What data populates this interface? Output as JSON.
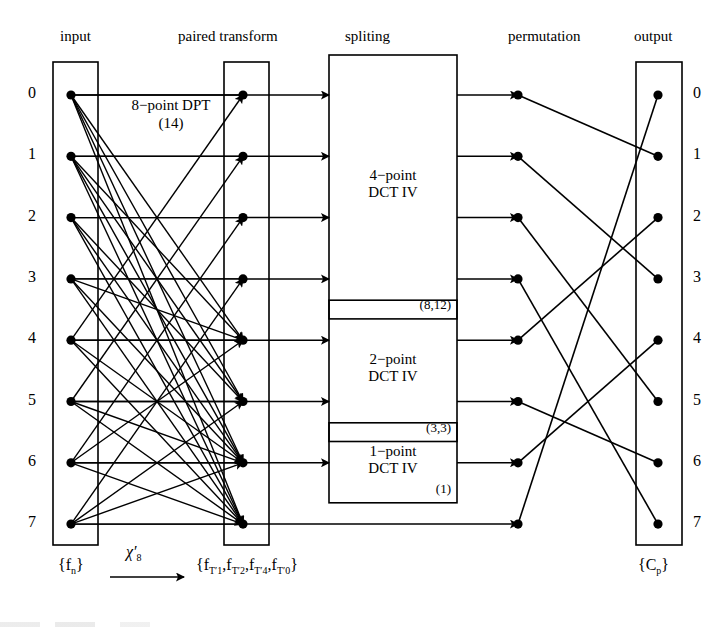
{
  "figure": {
    "columns": [
      {
        "key": "input",
        "label": "input"
      },
      {
        "key": "paired_transform",
        "label": "paired transform"
      },
      {
        "key": "splitting",
        "label": "spliting"
      },
      {
        "key": "permutation",
        "label": "permutation"
      },
      {
        "key": "output",
        "label": "output"
      }
    ],
    "input_indices": [
      "0",
      "1",
      "2",
      "3",
      "4",
      "5",
      "6",
      "7"
    ],
    "output_indices": [
      "0",
      "1",
      "2",
      "3",
      "4",
      "5",
      "6",
      "7"
    ],
    "annotations": {
      "dpt_name": "8−point DPT",
      "dpt_cost": "(14)",
      "input_set": "{f",
      "input_set_sub": "n",
      "input_set_close": "}",
      "arrow_symbol": "χ′",
      "arrow_symbol_sub": "8",
      "paired_set_open": "{f",
      "paired_terms": [
        "T′",
        "T′",
        "T′",
        "T′"
      ],
      "paired_term_subs": [
        "1",
        "2",
        "4",
        "0"
      ],
      "paired_set_close": "}",
      "output_set": "{C",
      "output_set_sub": "p",
      "output_set_close": "}"
    },
    "blocks": [
      {
        "name": "4-point DCT IV",
        "line1": "4−point",
        "line2": "DCT IV",
        "cost": "(8,12)",
        "inputs": [
          0,
          1,
          2,
          3
        ],
        "outputs": [
          0,
          1,
          2,
          3
        ]
      },
      {
        "name": "2-point DCT IV",
        "line1": "2−point",
        "line2": "DCT IV",
        "cost": "(3,3)",
        "inputs": [
          4,
          5
        ],
        "outputs": [
          4,
          5
        ]
      },
      {
        "name": "1-point DCT IV",
        "line1": "1−point",
        "line2": "DCT IV",
        "cost": "(1)",
        "inputs": [
          6
        ],
        "outputs": [
          6
        ]
      }
    ],
    "bypass_row": 7,
    "permutation_map": [
      1,
      3,
      5,
      7,
      2,
      6,
      4,
      0
    ],
    "dpt_edges": [
      [
        0,
        0
      ],
      [
        0,
        4
      ],
      [
        0,
        5
      ],
      [
        0,
        6
      ],
      [
        0,
        7
      ],
      [
        1,
        1
      ],
      [
        1,
        4
      ],
      [
        1,
        5
      ],
      [
        1,
        6
      ],
      [
        1,
        7
      ],
      [
        2,
        2
      ],
      [
        2,
        5
      ],
      [
        2,
        6
      ],
      [
        2,
        7
      ],
      [
        3,
        3
      ],
      [
        3,
        4
      ],
      [
        3,
        6
      ],
      [
        3,
        7
      ],
      [
        4,
        4
      ],
      [
        4,
        0
      ],
      [
        4,
        6
      ],
      [
        4,
        7
      ],
      [
        5,
        5
      ],
      [
        5,
        1
      ],
      [
        5,
        6
      ],
      [
        5,
        7
      ],
      [
        6,
        6
      ],
      [
        6,
        2
      ],
      [
        6,
        7
      ],
      [
        6,
        4
      ],
      [
        7,
        7
      ],
      [
        7,
        3
      ],
      [
        7,
        6
      ],
      [
        7,
        5
      ]
    ],
    "colors": {
      "line": "#000000",
      "node": "#000000",
      "box_border": "#000000",
      "background": "#ffffff"
    }
  }
}
